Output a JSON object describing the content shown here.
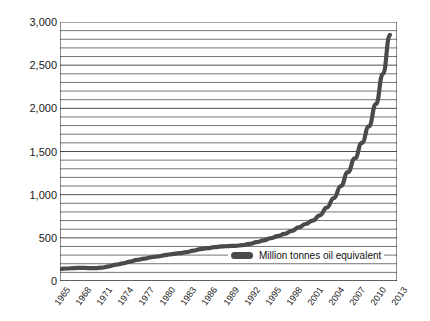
{
  "chart_data": {
    "type": "line",
    "title": "",
    "subtitle": "",
    "xlabel": "",
    "ylabel": "",
    "ylim": [
      0,
      3000
    ],
    "xlim": [
      1965,
      2013
    ],
    "grid": true,
    "grid_step": 100,
    "legend_position": "inside-bottom-right",
    "y_ticks": [
      "0",
      "500",
      "1,000",
      "1,500",
      "2,000",
      "2,500",
      "3,000"
    ],
    "y_tick_values": [
      0,
      500,
      1000,
      1500,
      2000,
      2500,
      3000
    ],
    "x_ticks": [
      "1965",
      "1968",
      "1971",
      "1974",
      "1977",
      "1980",
      "1983",
      "1986",
      "1989",
      "1992",
      "1995",
      "1998",
      "2001",
      "2004",
      "2007",
      "2010",
      "2013"
    ],
    "x_tick_values": [
      1965,
      1968,
      1971,
      1974,
      1977,
      1980,
      1983,
      1986,
      1989,
      1992,
      1995,
      1998,
      2001,
      2004,
      2007,
      2010,
      2013
    ],
    "series": [
      {
        "name": "Million tonnes oil equivalent",
        "color": "#4a4a4a",
        "x": [
          1965,
          1966,
          1967,
          1968,
          1969,
          1970,
          1971,
          1972,
          1973,
          1974,
          1975,
          1976,
          1977,
          1978,
          1979,
          1980,
          1981,
          1982,
          1983,
          1984,
          1985,
          1986,
          1987,
          1988,
          1989,
          1990,
          1991,
          1992,
          1993,
          1994,
          1995,
          1996,
          1997,
          1998,
          1999,
          2000,
          2001,
          2002,
          2003,
          2004,
          2005,
          2006,
          2007,
          2008,
          2009,
          2010,
          2011,
          2012
        ],
        "values": [
          140,
          145,
          150,
          152,
          150,
          148,
          155,
          170,
          190,
          205,
          225,
          245,
          260,
          275,
          285,
          300,
          312,
          322,
          335,
          352,
          370,
          380,
          392,
          400,
          405,
          408,
          415,
          430,
          450,
          470,
          495,
          520,
          545,
          580,
          620,
          660,
          700,
          760,
          850,
          960,
          1100,
          1260,
          1420,
          1600,
          1790,
          2050,
          2400,
          2850
        ]
      }
    ],
    "legend": [
      {
        "label": "Million tonnes oil equivalent",
        "color": "#4a4a4a"
      }
    ]
  },
  "colors": {
    "line": "#4a4a4a",
    "grid": "#3a3a3a",
    "axis": "#1a1a1a",
    "background": "#ffffff"
  }
}
